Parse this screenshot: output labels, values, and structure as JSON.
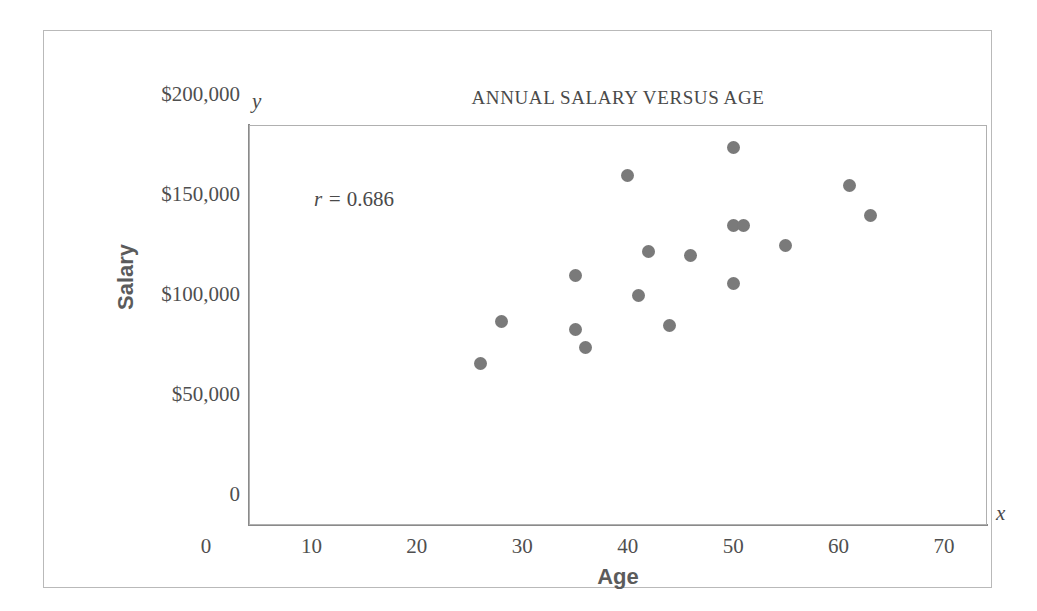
{
  "chart_data": {
    "type": "scatter",
    "title": "ANNUAL SALARY VERSUS AGE",
    "xlabel": "Age",
    "ylabel": "Salary",
    "x_var": "x",
    "y_var": "y",
    "annotation": "r = 0.686",
    "annotation_symbol": "r =",
    "annotation_value": "0.686",
    "correlation": 0.686,
    "grid": false,
    "legend": null,
    "xlim": [
      0,
      70
    ],
    "ylim": [
      0,
      200000
    ],
    "xticks": [
      0,
      10,
      20,
      30,
      40,
      50,
      60,
      70
    ],
    "xtick_labels": [
      "0",
      "10",
      "20",
      "30",
      "40",
      "50",
      "60",
      "70"
    ],
    "yticks": [
      0,
      50000,
      100000,
      150000,
      200000
    ],
    "ytick_labels": [
      "0",
      "$50,000",
      "$100,000",
      "$150,000",
      "$200,000"
    ],
    "marker_color": "#7a7a7a",
    "points": [
      {
        "x": 26,
        "y": 66000
      },
      {
        "x": 28,
        "y": 87000
      },
      {
        "x": 35,
        "y": 110000
      },
      {
        "x": 35,
        "y": 83000
      },
      {
        "x": 36,
        "y": 74000
      },
      {
        "x": 40,
        "y": 160000
      },
      {
        "x": 41,
        "y": 100000
      },
      {
        "x": 42,
        "y": 122000
      },
      {
        "x": 44,
        "y": 85000
      },
      {
        "x": 46,
        "y": 120000
      },
      {
        "x": 50,
        "y": 174000
      },
      {
        "x": 50,
        "y": 106000
      },
      {
        "x": 50,
        "y": 135000
      },
      {
        "x": 51,
        "y": 135000
      },
      {
        "x": 55,
        "y": 125000
      },
      {
        "x": 61,
        "y": 155000
      },
      {
        "x": 63,
        "y": 140000
      }
    ]
  }
}
